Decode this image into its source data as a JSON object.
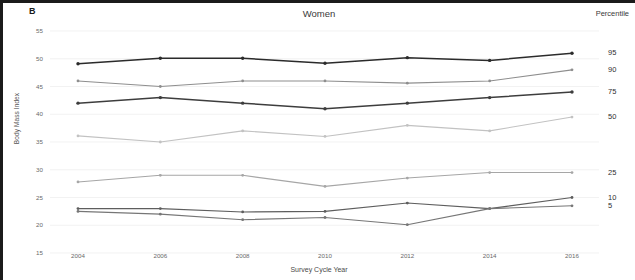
{
  "figure": {
    "panel_label": "B",
    "title": "Women",
    "percentile_header": "Percentile",
    "y_axis_title": "Body Mass Index",
    "x_axis_title": "Survey Cycle Year"
  },
  "chart_data": {
    "type": "line",
    "title": "Women",
    "xlabel": "Survey Cycle Year",
    "ylabel": "Body Mass Index",
    "x": [
      2004,
      2006,
      2008,
      2010,
      2012,
      2014,
      2016
    ],
    "xtick_labels": [
      "2004",
      "2006",
      "2008",
      "2010",
      "2012",
      "2014",
      "2016"
    ],
    "ytick_labels": [
      "55",
      "50",
      "45",
      "40",
      "35",
      "30",
      "25",
      "20",
      "15"
    ],
    "yticks": [
      55,
      50,
      45,
      40,
      35,
      30,
      25,
      20,
      15
    ],
    "ylim": [
      15,
      55
    ],
    "xlim": [
      2003,
      2017
    ],
    "grid": true,
    "legend_position": "right-of-axes",
    "series": [
      {
        "name": "95",
        "label": "95",
        "color": "#2b2b2b",
        "values": [
          49.1,
          50.1,
          50.1,
          49.2,
          50.2,
          49.7,
          51.0
        ]
      },
      {
        "name": "90",
        "label": "90",
        "color": "#8e8e8e",
        "values": [
          46.0,
          45.0,
          46.0,
          46.0,
          45.6,
          46.0,
          48.0
        ]
      },
      {
        "name": "75",
        "label": "75",
        "color": "#3d3d3d",
        "values": [
          42.0,
          43.0,
          42.0,
          41.0,
          42.0,
          43.0,
          44.0
        ]
      },
      {
        "name": "50",
        "label": "50",
        "color": "#c2c2c2",
        "values": [
          36.1,
          35.0,
          37.0,
          36.0,
          38.0,
          37.0,
          39.5
        ]
      },
      {
        "name": "25",
        "label": "25",
        "color": "#a6a6a6",
        "values": [
          27.8,
          29.0,
          29.0,
          27.0,
          28.5,
          29.5,
          29.5
        ]
      },
      {
        "name": "10",
        "label": "10",
        "color": "#5e5e5e",
        "values": [
          23.0,
          23.0,
          22.4,
          22.5,
          24.0,
          23.0,
          25.0
        ]
      },
      {
        "name": "5",
        "label": "5",
        "color": "#767676",
        "values": [
          22.5,
          22.0,
          21.0,
          21.4,
          20.1,
          23.0,
          23.5
        ]
      }
    ]
  }
}
